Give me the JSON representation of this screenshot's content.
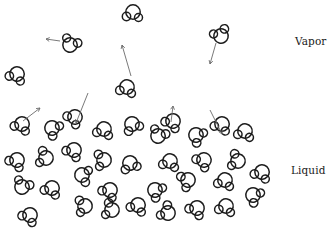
{
  "labels": {
    "vapor": "Vapor",
    "liquid": "Liquid"
  },
  "colors": {
    "molecule_stroke": "#1c1c1c",
    "arrow_stroke": "#6a6a6a",
    "background": "#ffffff",
    "label_text": "#1a1a1a"
  },
  "molecule_shape": "one large circle with two smaller attached circles (water-like molecule)",
  "vapor_molecules": [
    {
      "x": 133,
      "y": 12,
      "rot": 0
    },
    {
      "x": 70,
      "y": 45,
      "rot": 200
    },
    {
      "x": 221,
      "y": 36,
      "rot": 150
    },
    {
      "x": 17,
      "y": 74,
      "rot": 20
    },
    {
      "x": 127,
      "y": 87,
      "rot": 10
    }
  ],
  "vapor_arrows": [
    {
      "x1": 60,
      "y1": 41,
      "x2": 46,
      "y2": 39
    },
    {
      "x1": 131,
      "y1": 76,
      "x2": 122,
      "y2": 45
    },
    {
      "x1": 216,
      "y1": 43,
      "x2": 210,
      "y2": 64
    }
  ],
  "liquid_arrows": [
    {
      "x1": 23,
      "y1": 121,
      "x2": 40,
      "y2": 108
    },
    {
      "x1": 88,
      "y1": 93,
      "x2": 76,
      "y2": 123
    },
    {
      "x1": 171,
      "y1": 122,
      "x2": 173,
      "y2": 106
    },
    {
      "x1": 210,
      "y1": 110,
      "x2": 222,
      "y2": 134
    }
  ],
  "liquid_molecules": [
    {
      "x": 22,
      "y": 124,
      "rot": 20
    },
    {
      "x": 52,
      "y": 128,
      "rot": 300
    },
    {
      "x": 75,
      "y": 117,
      "rot": 40
    },
    {
      "x": 104,
      "y": 129,
      "rot": 10
    },
    {
      "x": 132,
      "y": 124,
      "rot": 330
    },
    {
      "x": 158,
      "y": 136,
      "rot": 200
    },
    {
      "x": 173,
      "y": 121,
      "rot": 30
    },
    {
      "x": 196,
      "y": 135,
      "rot": 300
    },
    {
      "x": 222,
      "y": 124,
      "rot": 20
    },
    {
      "x": 245,
      "y": 131,
      "rot": 10
    },
    {
      "x": 17,
      "y": 160,
      "rot": 30
    },
    {
      "x": 46,
      "y": 158,
      "rot": 100
    },
    {
      "x": 74,
      "y": 150,
      "rot": 30
    },
    {
      "x": 104,
      "y": 160,
      "rot": 80
    },
    {
      "x": 130,
      "y": 163,
      "rot": 340
    },
    {
      "x": 170,
      "y": 161,
      "rot": 10
    },
    {
      "x": 204,
      "y": 160,
      "rot": 40
    },
    {
      "x": 238,
      "y": 161,
      "rot": 100
    },
    {
      "x": 22,
      "y": 187,
      "rot": 200
    },
    {
      "x": 52,
      "y": 188,
      "rot": 20
    },
    {
      "x": 82,
      "y": 175,
      "rot": 280
    },
    {
      "x": 110,
      "y": 190,
      "rot": 30
    },
    {
      "x": 155,
      "y": 190,
      "rot": 300
    },
    {
      "x": 188,
      "y": 180,
      "rot": 60
    },
    {
      "x": 225,
      "y": 180,
      "rot": 10
    },
    {
      "x": 262,
      "y": 172,
      "rot": 20
    },
    {
      "x": 30,
      "y": 215,
      "rot": 30
    },
    {
      "x": 85,
      "y": 206,
      "rot": 80
    },
    {
      "x": 112,
      "y": 210,
      "rot": 100
    },
    {
      "x": 138,
      "y": 205,
      "rot": 20
    },
    {
      "x": 168,
      "y": 213,
      "rot": 120
    },
    {
      "x": 197,
      "y": 208,
      "rot": 30
    },
    {
      "x": 226,
      "y": 206,
      "rot": 10
    },
    {
      "x": 253,
      "y": 195,
      "rot": 300
    }
  ]
}
